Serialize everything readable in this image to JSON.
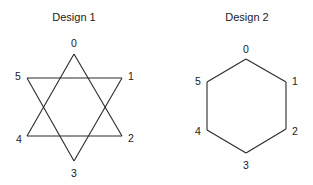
{
  "diagrams": [
    {
      "title": "Design 1",
      "shape": "hexagram",
      "vertices": [
        {
          "label": "0",
          "x": 74,
          "y": 54,
          "lx": 74,
          "ly": 47
        },
        {
          "label": "1",
          "x": 122,
          "y": 78,
          "lx": 131,
          "ly": 80
        },
        {
          "label": "2",
          "x": 122,
          "y": 136,
          "lx": 131,
          "ly": 142
        },
        {
          "label": "3",
          "x": 74,
          "y": 161,
          "lx": 74,
          "ly": 177
        },
        {
          "label": "4",
          "x": 27,
          "y": 136,
          "lx": 19,
          "ly": 143
        },
        {
          "label": "5",
          "x": 27,
          "y": 78,
          "lx": 18,
          "ly": 80
        }
      ],
      "edges": [
        [
          0,
          2
        ],
        [
          2,
          4
        ],
        [
          4,
          0
        ],
        [
          5,
          1
        ],
        [
          1,
          3
        ],
        [
          3,
          5
        ]
      ]
    },
    {
      "title": "Design 2",
      "shape": "hexagon",
      "vertices": [
        {
          "label": "0",
          "x": 246,
          "y": 59,
          "lx": 246,
          "ly": 53
        },
        {
          "label": "1",
          "x": 286,
          "y": 82,
          "lx": 295,
          "ly": 85
        },
        {
          "label": "2",
          "x": 286,
          "y": 129,
          "lx": 295,
          "ly": 135
        },
        {
          "label": "3",
          "x": 246,
          "y": 153,
          "lx": 246,
          "ly": 169
        },
        {
          "label": "4",
          "x": 207,
          "y": 130,
          "lx": 198,
          "ly": 135
        },
        {
          "label": "5",
          "x": 207,
          "y": 82,
          "lx": 198,
          "ly": 85
        }
      ],
      "edges": [
        [
          0,
          1
        ],
        [
          1,
          2
        ],
        [
          2,
          3
        ],
        [
          3,
          4
        ],
        [
          4,
          5
        ],
        [
          5,
          0
        ]
      ]
    }
  ],
  "title_positions": [
    {
      "x": 74,
      "y": 21
    },
    {
      "x": 247,
      "y": 21
    }
  ]
}
